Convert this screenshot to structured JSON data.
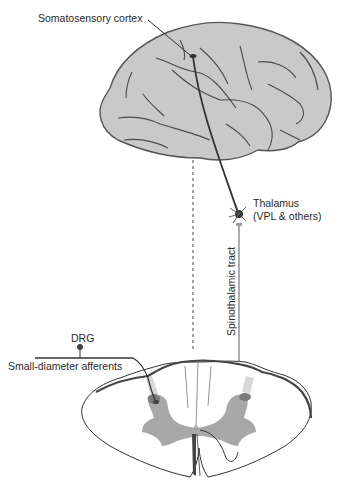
{
  "diagram": {
    "type": "anatomical pathway",
    "labels": {
      "cortex": "Somatosensory cortex",
      "thalamus_line1": "Thalamus",
      "thalamus_line2": "(VPL & others)",
      "tract": "Spinothalamic tract",
      "drg": "DRG",
      "afferents": "Small-diameter afferents"
    },
    "colors": {
      "brain_fill": "#c9c9c9",
      "brain_outline": "#555555",
      "gray_matter": "#a8a8a8",
      "pathway": "#333333",
      "tract_line": "#8a8a8a"
    }
  }
}
